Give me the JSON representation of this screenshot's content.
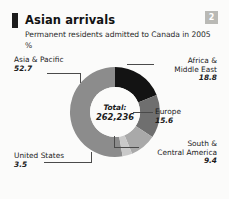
{
  "header": {
    "title": "Asian arrivals",
    "subtitle": "Permanent residents admitted to Canada in 2005",
    "unit": "%",
    "badge": "2"
  },
  "chart_data": {
    "type": "pie",
    "title": "Asian arrivals",
    "subtitle": "Permanent residents admitted to Canada in 2005",
    "ylabel": "%",
    "xlabel": "",
    "donut": true,
    "legend": "callout-labels",
    "grid": false,
    "total_label": "Total:",
    "total_value": "262,236",
    "categories": [
      "Asia & Pacific",
      "Africa & Middle East",
      "Europe",
      "South & Central America",
      "United States"
    ],
    "values": [
      52.7,
      18.8,
      15.6,
      9.4,
      3.5
    ],
    "colors": [
      "#8c8c8c",
      "#131313",
      "#6f6f6f",
      "#a9a9a9",
      "#c9c9c9"
    ],
    "slices": [
      {
        "name": "Asia & Pacific",
        "name_line_1": "Asia & Pacific",
        "value": "52.7",
        "color": "#8c8c8c"
      },
      {
        "name": "Africa & Middle East",
        "name_line_1": "Africa &",
        "name_line_2": "Middle East",
        "value": "18.8",
        "color": "#131313"
      },
      {
        "name": "Europe",
        "name_line_1": "Europe",
        "value": "15.6",
        "color": "#6f6f6f"
      },
      {
        "name": "South & Central America",
        "name_line_1": "South &",
        "name_line_2": "Central America",
        "value": "9.4",
        "color": "#a9a9a9"
      },
      {
        "name": "United States",
        "name_line_1": "United States",
        "value": "3.5",
        "color": "#c9c9c9"
      }
    ]
  }
}
